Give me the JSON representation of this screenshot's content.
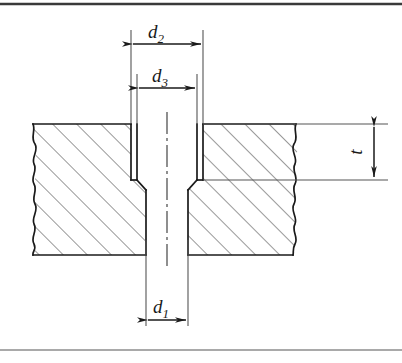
{
  "figure": {
    "kind": "engineering-section-drawing",
    "line_color": "#1a1a1a",
    "thin_line_color": "#555555",
    "hatch_color": "#333333",
    "background_color": "#ffffff",
    "top_rule_color": "#3a3a3a",
    "bottom_rule_color": "#8c8c8c"
  },
  "dimensions": [
    {
      "id": "d2",
      "symbol": "d",
      "subscript": "2",
      "label": "d2",
      "meaning": "counterbore diameter",
      "orientation": "horizontal",
      "position": "top"
    },
    {
      "id": "d3",
      "symbol": "d",
      "subscript": "3",
      "label": "d3",
      "meaning": "intermediate bore diameter",
      "orientation": "horizontal",
      "position": "upper-middle"
    },
    {
      "id": "d1",
      "symbol": "d",
      "subscript": "1",
      "label": "d1",
      "meaning": "through hole diameter",
      "orientation": "horizontal",
      "position": "bottom"
    },
    {
      "id": "t",
      "symbol": "t",
      "subscript": "",
      "label": "t",
      "meaning": "counterbore depth",
      "orientation": "vertical",
      "position": "right"
    }
  ],
  "geometry": {
    "part_top_y": 124,
    "part_bottom_y": 255,
    "counterbore_bottom_y": 180,
    "counterbore_left_x": 131,
    "counterbore_right_x": 203,
    "bore_left_x": 137,
    "bore_right_x": 197,
    "hole_left_x": 146,
    "hole_right_x": 188,
    "center_x": 167,
    "break_left_x": 33,
    "break_right_x": 296
  }
}
